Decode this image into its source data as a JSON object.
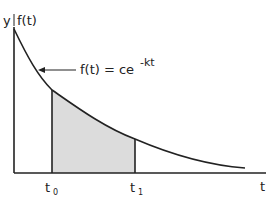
{
  "diagram": {
    "y_axis_label": "y",
    "function_label": "f(t)",
    "equation": {
      "base": "f(t) = ce",
      "exponent": "-kt"
    },
    "x_axis_label": "t",
    "bounds": [
      {
        "label": "t",
        "subscript": "0"
      },
      {
        "label": "t",
        "subscript": "1"
      }
    ],
    "shaded_region": "area under f(t) between t0 and t1",
    "colors": {
      "line": "#222222",
      "shade": "#dcdcdc"
    }
  }
}
